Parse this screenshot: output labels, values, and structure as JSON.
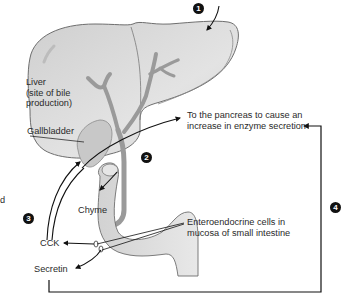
{
  "diagram": {
    "labels": {
      "liver_line1": "Liver",
      "liver_line2": "(site of bile",
      "liver_line3": "production)",
      "gallbladder": "Gallbladder",
      "pancreas_line1": "To the pancreas to cause an",
      "pancreas_line2": "increase in enzyme secretion",
      "chyme": "Chyme",
      "cck": "CCK",
      "secretin": "Secretin",
      "entero_line1": "Enteroendocrine cells in",
      "entero_line2": "mucosa of small intestine",
      "cutoff_fragment": "d"
    },
    "markers": [
      "1",
      "2",
      "3",
      "4"
    ],
    "colors": {
      "organ_fill": "#d9d9d9",
      "organ_stroke": "#6e6e6e",
      "duct_fill": "#c6c6c6",
      "arrow": "#111111",
      "text": "#2a2a2a",
      "marker_bg": "#111111"
    }
  }
}
